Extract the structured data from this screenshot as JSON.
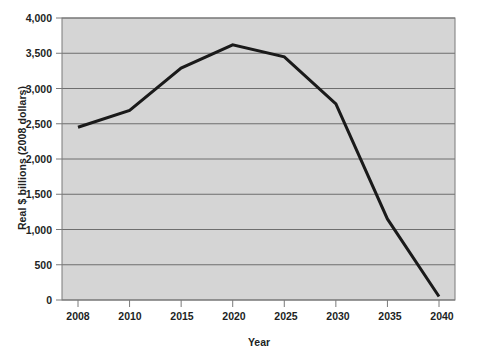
{
  "chart_data": {
    "type": "line",
    "title": "",
    "xlabel": "Year",
    "ylabel": "Real $ billions (2008 dollars)",
    "categories": [
      "2008",
      "2010",
      "2015",
      "2020",
      "2025",
      "2030",
      "2035",
      "2040"
    ],
    "values": [
      2450,
      2690,
      3290,
      3620,
      3450,
      2780,
      1150,
      50
    ],
    "series": [
      {
        "name": "Real $ billions (2008 dollars)",
        "values": [
          2450,
          2690,
          3290,
          3620,
          3450,
          2780,
          1150,
          50
        ]
      }
    ],
    "ylim": [
      0,
      4000
    ],
    "yticks": [
      0,
      500,
      1000,
      1500,
      2000,
      2500,
      3000,
      3500,
      4000
    ],
    "ytick_labels": [
      "0",
      "500",
      "1,000",
      "1,500",
      "2,000",
      "2,500",
      "3,000",
      "3,500",
      "4,000"
    ],
    "xtick_labels": [
      "2008",
      "2010",
      "2015",
      "2020",
      "2025",
      "2030",
      "2035",
      "2040"
    ],
    "grid": true,
    "grid_axis": "y",
    "legend": "none",
    "colors": {
      "line": "#1a1a1a",
      "plot_background": "#d5d5d5",
      "gridline": "#6e6e6e",
      "frame": "#7a7a7a",
      "text": "#221f1f",
      "page_background": "#ffffff"
    }
  },
  "axis": {
    "y_title": "Real $ billions (2008 dollars)",
    "x_title": "Year"
  },
  "cropped_title": ""
}
